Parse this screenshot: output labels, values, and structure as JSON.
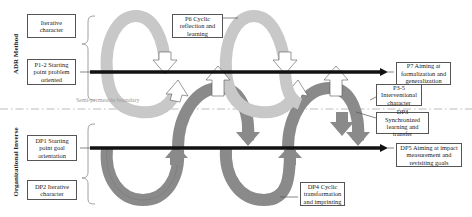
{
  "diagram": {
    "sections": {
      "top_label": "ADR Method",
      "bottom_label": "Organizational Inverse"
    },
    "boundary_label": "Semi-permeable boundary",
    "top_boxes": [
      {
        "id": "iterative",
        "text": "Iterative character"
      },
      {
        "id": "p1-2",
        "text": "P1-2 Starting point problem oriented"
      },
      {
        "id": "p6",
        "text": "P6 Cyclic reflection and learning"
      },
      {
        "id": "p7",
        "text": "P7 Aiming at formalization and generalization"
      },
      {
        "id": "p3-5",
        "text": "P3-5 Interventional character"
      }
    ],
    "bottom_boxes": [
      {
        "id": "dp1",
        "text": "DP1 Starting point goal orientation"
      },
      {
        "id": "dp2",
        "text": "DP2 Iterative character"
      },
      {
        "id": "dp3",
        "text": "DP3 Synchronized learning and transfer"
      },
      {
        "id": "dp4",
        "text": "DP4 Cyclic transformation and imprinting"
      },
      {
        "id": "dp5",
        "text": "DP5 Aiming at impact measurement and revisiting goals"
      }
    ],
    "colors": {
      "light_arrow": "#c8c8c8",
      "dark_arrow": "#8a8a8a",
      "hollow_arrow": "#ffffff",
      "timeline": "#111111",
      "boundary_line": "#aaaaaa"
    }
  }
}
